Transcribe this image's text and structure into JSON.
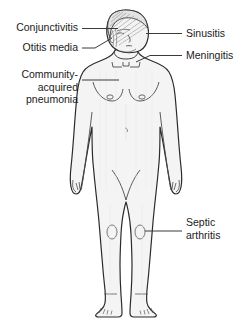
{
  "diagram": {
    "colors": {
      "background": "#ffffff",
      "body_fill": "#f4f4f4",
      "outline": "#2b2b2b",
      "leader_line": "#3a3a3a",
      "hair_shading": "#8a8a8a",
      "text": "#1a1a1a"
    },
    "labels": {
      "conjunctivitis": "Conjunctivitis",
      "otitis_media": "Otitis media",
      "community_acquired_pneumonia": "Community-\nacquired\npneumonia",
      "sinusitis": "Sinusitis",
      "meningitis": "Meningitis",
      "septic_arthritis": "Septic\narthritis"
    }
  }
}
